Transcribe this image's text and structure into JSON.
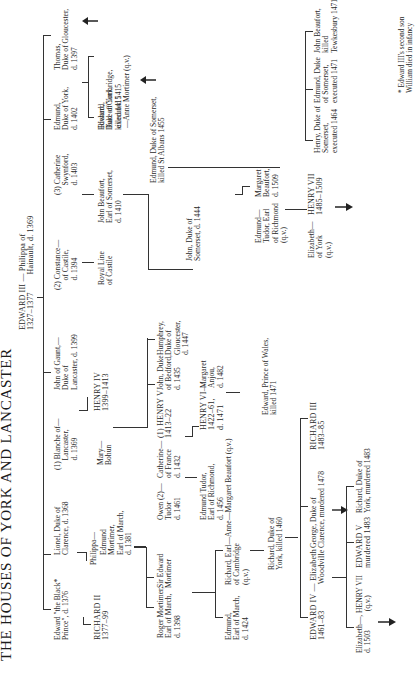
{
  "title": "THE HOUSES OF YORK AND LANCASTER",
  "footnote": "* Edward III's second son\nWilliam died in infancy",
  "persons": {
    "edward3": "EDWARD III — Philippa of\n1327–1377        Hainault, d. 1369",
    "black_prince": "Edward \"the Black*\nPrince\", d. 1376",
    "lionel": "Lionel, Duke of\nClarence, d. 1368",
    "blanche": "(1) Blanche of—\n     Lancaster,\n     d. 1369",
    "gaunt": "John of Gaunt,—\nDuke of\nLancaster, d. 1399",
    "constance": "(2) Constance—\n     of Castile,\n     d. 1394",
    "swynford": "(3) Catherine\n     Swynford,\n     d. 1403",
    "edmund_york": "Edmund,\nDuke of York,\nd. 1402",
    "thomas": "Thomas,\nDuke of Gloucester,\nd. 1397",
    "richard2": "RICHARD II\n1377–99",
    "philippa": "Philippa—",
    "edmund_mortimer": "Edmund\nMortimer,\nEarl of March,\nd. 1381",
    "mary_bohun": "Mary—\nBohun",
    "henry4": "HENRY IV\n1399–1413",
    "royal_castile": "Royal Line\nof Castile",
    "john_beaufort_1410": "John Beaufort,\nEarl of Somerset,\nd. 1410",
    "edward_york_1415": "Edward,\nDuke of York,\nkilled 1415",
    "richard_cambridge_top": "Richard,\nEarl of Cambridge,\nexecuted 1415\n—Anne Mortimer (q.v.)",
    "roger_mortimer": "Roger Mortimer,\nEarl of March,\nd. 1398",
    "sir_edward_mortimer": "Sir Edward\nMortimer",
    "owen_tudor": "Owen (2)—\nTudor\nd. 1461",
    "catherine_france": "Catherine—\nof France\nd. 1432",
    "henry5": "(1) HENRY V\n1413–22",
    "john_bedford": "John, Duke\nof Bedford,\nd. 1435",
    "humphrey": "Humphrey,\nDuke of\nGloucester,\nd. 1447",
    "john_somerset_1444": "John, Duke of\nSomerset, d. 1444",
    "edmund_somerset_1455": "Edmund, Duke of Somerset,\nkilled St Albans 1455",
    "edmund_march_1424": "Edmund,\nEarl of March,\nd. 1424",
    "richard_cambridge": "Richard, Earl—Anne\nof Cambridge\n(q.v.)",
    "edmund_tudor": "Edmund Tudor,\nEarl of Richmond,\nd. 1456\n—Margaret Beaufort (q.v.)",
    "henry6": "HENRY VI—\n1422–61,\nd. 1471",
    "margaret_anjou": "Margaret\nAnjou,\nd. 1482",
    "edmund_tudor_richmond": "Edmund—\nTudor, Earl\nof Richmond\n(q.v.)",
    "margaret_beaufort": "Margaret\nBeaufort,\nd. 1509",
    "henry_somerset_1464": "Henry, Duke of\nSomerset,\nexecuted 1464",
    "edmund_somerset_1471": "Edmund, Duke\nof Somerset,\nexecuted 1471",
    "john_beaufort_1471": "John Beaufort,\nkilled\nTewkesbury 1471",
    "richard_york_1460": "Richard, Duke of\nYork, killed 1460",
    "edward_prince_wales": "Edward, Prince of Wales,\nkilled 1471",
    "elizabeth_of_york": "Elizabeth—\nof York\n(q.v.)",
    "henry7": "HENRY VII\n1485–1509",
    "edward4": "EDWARD IV — Elizabeth\n1461–83            Woodville",
    "george_clarence": "George, Duke of\nClarence, murdered 1478",
    "richard3": "RICHARD III\n1483–85",
    "elizabeth_henry7": "Elizabeth—, HENRY VII\nd. 1503          (q.v.)",
    "edward5": "EDWARD V\nmurdered 1483",
    "richard_york_1483": "Richard, Duke of\nYork, murdered 1483"
  },
  "colors": {
    "ink": "#2a2a2a",
    "paper": "#ffffff"
  }
}
